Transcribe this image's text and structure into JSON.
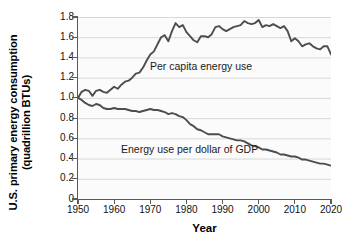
{
  "chart_data": {
    "type": "line",
    "title": "",
    "xlabel": "Year",
    "ylabel": "U.S. primary energy consumption (quadrillion BTUs)",
    "ylabel_line1": "U.S. primary energy consumption",
    "ylabel_line2": "(quadrillion BTUs)",
    "xlim": [
      1950,
      2020
    ],
    "ylim": [
      0,
      1.8
    ],
    "xticks": [
      1950,
      1960,
      1970,
      1980,
      1990,
      2000,
      2010,
      2020
    ],
    "xtick_labels": [
      "1950",
      "1960",
      "1970",
      "1980",
      "1990",
      "2000",
      "2010",
      "2020"
    ],
    "yticks": [
      0,
      0.2,
      0.4,
      0.6,
      0.8,
      1.0,
      1.2,
      1.4,
      1.6,
      1.8
    ],
    "ytick_labels": [
      "0",
      "0.2",
      "0.4",
      "0.6",
      "0.8",
      "1.0",
      "1.2",
      "1.4",
      "1.6",
      "1.8"
    ],
    "grid": "horizontal",
    "grid_color": "#d8d8d8",
    "legend_position": "inline-annotations",
    "line_color": "#4d4d4d",
    "background_color": "#fbfbfb",
    "x": [
      1950,
      1951,
      1952,
      1953,
      1954,
      1955,
      1956,
      1957,
      1958,
      1959,
      1960,
      1961,
      1962,
      1963,
      1964,
      1965,
      1966,
      1967,
      1968,
      1969,
      1970,
      1971,
      1972,
      1973,
      1974,
      1975,
      1976,
      1977,
      1978,
      1979,
      1980,
      1981,
      1982,
      1983,
      1984,
      1985,
      1986,
      1987,
      1988,
      1989,
      1990,
      1991,
      1992,
      1993,
      1994,
      1995,
      1996,
      1997,
      1998,
      1999,
      2000,
      2001,
      2002,
      2003,
      2004,
      2005,
      2006,
      2007,
      2008,
      2009,
      2010,
      2011,
      2012,
      2013,
      2014,
      2015,
      2016,
      2017,
      2018,
      2019,
      2020
    ],
    "series": [
      {
        "name": "Per capita energy use",
        "annotation": "Per capita energy use",
        "values": [
          1.0,
          1.06,
          1.08,
          1.07,
          1.02,
          1.07,
          1.08,
          1.06,
          1.05,
          1.08,
          1.11,
          1.09,
          1.13,
          1.16,
          1.17,
          1.2,
          1.24,
          1.25,
          1.3,
          1.37,
          1.43,
          1.46,
          1.53,
          1.6,
          1.62,
          1.56,
          1.66,
          1.74,
          1.7,
          1.72,
          1.65,
          1.61,
          1.57,
          1.55,
          1.61,
          1.61,
          1.6,
          1.63,
          1.7,
          1.71,
          1.68,
          1.66,
          1.68,
          1.7,
          1.71,
          1.72,
          1.76,
          1.74,
          1.73,
          1.74,
          1.77,
          1.7,
          1.72,
          1.71,
          1.73,
          1.71,
          1.69,
          1.71,
          1.66,
          1.56,
          1.59,
          1.56,
          1.51,
          1.53,
          1.54,
          1.51,
          1.49,
          1.48,
          1.51,
          1.51,
          1.43
        ]
      },
      {
        "name": "Energy use per dollar of GDP",
        "annotation": "Energy use per dollar of GDP",
        "values": [
          1.0,
          0.98,
          0.95,
          0.93,
          0.92,
          0.94,
          0.93,
          0.9,
          0.89,
          0.89,
          0.9,
          0.89,
          0.89,
          0.89,
          0.88,
          0.87,
          0.87,
          0.86,
          0.87,
          0.88,
          0.89,
          0.88,
          0.88,
          0.87,
          0.86,
          0.84,
          0.85,
          0.84,
          0.82,
          0.81,
          0.78,
          0.74,
          0.72,
          0.69,
          0.68,
          0.66,
          0.64,
          0.64,
          0.64,
          0.64,
          0.62,
          0.61,
          0.6,
          0.59,
          0.58,
          0.58,
          0.57,
          0.55,
          0.53,
          0.52,
          0.51,
          0.49,
          0.49,
          0.48,
          0.47,
          0.46,
          0.44,
          0.44,
          0.43,
          0.42,
          0.42,
          0.41,
          0.39,
          0.39,
          0.38,
          0.37,
          0.36,
          0.35,
          0.35,
          0.34,
          0.33
        ]
      }
    ]
  }
}
